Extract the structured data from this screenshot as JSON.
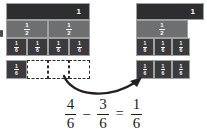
{
  "figure": {
    "equation_text": "4/6 - 3/6 = 1/6",
    "colors": {
      "whole_bar": "#2e2e30",
      "half_bar": "#6e6f71",
      "sixth_bar": "#3b3b3d",
      "cell_border": "#9fa0a2",
      "dashed_outline": "#2e2e30",
      "equation_text": "#231f20",
      "background": "#ffffff"
    }
  },
  "left_model": {
    "whole_label": "1",
    "halves": [
      {
        "numerator": "1",
        "denominator": "2"
      },
      {
        "numerator": "1",
        "denominator": "2"
      }
    ],
    "sixths": [
      {
        "numerator": "1",
        "denominator": "6"
      },
      {
        "numerator": "1",
        "denominator": "6"
      },
      {
        "numerator": "1",
        "denominator": "6"
      },
      {
        "numerator": "1",
        "denominator": "6"
      }
    ],
    "remainder_row": {
      "filled": [
        {
          "numerator": "1",
          "denominator": "6"
        }
      ],
      "empty_count": 3
    }
  },
  "right_model": {
    "whole_label": "1",
    "halves": [
      {
        "numerator": "1",
        "denominator": "2"
      }
    ],
    "sixths": [
      {
        "numerator": "1",
        "denominator": "6"
      },
      {
        "numerator": "1",
        "denominator": "6"
      },
      {
        "numerator": "1",
        "denominator": "6"
      }
    ],
    "result_row": [
      {
        "numerator": "1",
        "denominator": "6"
      },
      {
        "numerator": "1",
        "denominator": "6"
      },
      {
        "numerator": "1",
        "denominator": "6"
      }
    ]
  },
  "equation": {
    "minuend": {
      "numerator": "4",
      "denominator": "6"
    },
    "minus_sign": "–",
    "subtrahend": {
      "numerator": "3",
      "denominator": "6"
    },
    "equals_sign": "=",
    "difference": {
      "numerator": "1",
      "denominator": "6"
    }
  }
}
